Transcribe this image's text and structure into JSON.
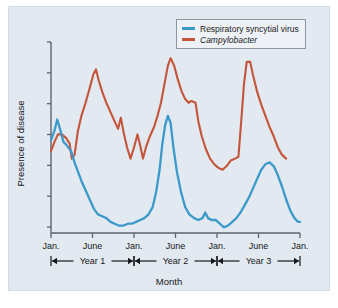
{
  "figure": {
    "background_color": "#e3e9f0",
    "frame_color": "#d2dae4"
  },
  "legend": {
    "position": "top-right",
    "entries": [
      {
        "label": "Respiratory syncytial virus",
        "color": "#3b9ac9",
        "italic": false,
        "swatch_name": "legend-swatch-rsv"
      },
      {
        "label": "Campylobacter",
        "color": "#c4543a",
        "italic": true,
        "swatch_name": "legend-swatch-campylobacter"
      }
    ]
  },
  "axes": {
    "y_title": "Presence of disease",
    "x_title": "Month",
    "y_tick_count": 7,
    "y_tick_labels": [
      "",
      "",
      "",
      "",
      "",
      "",
      ""
    ],
    "x_tick_labels": [
      "Jan.",
      "June",
      "Jan.",
      "June",
      "Jan.",
      "June",
      "Jan."
    ],
    "axis_color": "#5d646d"
  },
  "year_brackets": [
    {
      "label": "Year 1",
      "start_tick": 0,
      "end_tick": 2
    },
    {
      "label": "Year 2",
      "start_tick": 2,
      "end_tick": 4
    },
    {
      "label": "Year 3",
      "start_tick": 4,
      "end_tick": 6
    }
  ],
  "chart_data": {
    "type": "line",
    "title": "",
    "subtitle": "",
    "xlabel": "Month",
    "ylabel": "Presence of disease",
    "xlim": [
      0,
      36
    ],
    "ylim": [
      0,
      100
    ],
    "grid": false,
    "legend_position": "top right",
    "x_tick_positions": [
      0,
      6,
      12,
      18,
      24,
      30,
      36
    ],
    "x_tick_labels": [
      "Jan.",
      "June",
      "Jan.",
      "June",
      "Jan.",
      "June",
      "Jan."
    ],
    "y_axis_labeled": false,
    "annotations": [
      "Year 1",
      "Year 2",
      "Year 3"
    ],
    "x": [
      0,
      1,
      2,
      3,
      4,
      5,
      6,
      7,
      8,
      9,
      10,
      11,
      12,
      13,
      14,
      15,
      16,
      17,
      18,
      19,
      20,
      21,
      22,
      23,
      24,
      25,
      26,
      27,
      28,
      29,
      30,
      31,
      32,
      33,
      34,
      35,
      36
    ],
    "series": [
      {
        "name": "Respiratory syncytial virus",
        "color": "#3b9ac9",
        "values": [
          52,
          58,
          48,
          45,
          38,
          28,
          22,
          15,
          10,
          7,
          5,
          5,
          4,
          6,
          7,
          12,
          22,
          43,
          62,
          50,
          25,
          12,
          8,
          6,
          9,
          7,
          4,
          3,
          6,
          12,
          22,
          32,
          38,
          33,
          22,
          12,
          6
        ]
      },
      {
        "name": "Campylobacter",
        "color": "#c4543a",
        "values": [
          46,
          52,
          53,
          50,
          42,
          44,
          62,
          75,
          88,
          78,
          70,
          62,
          53,
          60,
          43,
          52,
          48,
          58,
          62,
          72,
          82,
          95,
          92,
          80,
          75,
          72,
          72,
          62,
          48,
          36,
          32,
          33,
          40,
          92,
          93,
          72,
          54
        ]
      }
    ],
    "series_full_resolution": {
      "note": "dense sampling used for rendering; x in months from start",
      "rsv": [
        [
          0.0,
          50
        ],
        [
          0.5,
          55
        ],
        [
          0.9,
          61
        ],
        [
          1.3,
          56
        ],
        [
          1.8,
          49
        ],
        [
          2.3,
          47
        ],
        [
          2.9,
          44
        ],
        [
          3.4,
          38
        ],
        [
          3.9,
          33
        ],
        [
          4.4,
          28
        ],
        [
          5.0,
          23
        ],
        [
          5.6,
          18
        ],
        [
          6.2,
          13
        ],
        [
          6.8,
          10
        ],
        [
          7.4,
          9
        ],
        [
          8.0,
          8
        ],
        [
          8.6,
          6
        ],
        [
          9.2,
          5
        ],
        [
          9.8,
          4
        ],
        [
          10.5,
          4
        ],
        [
          11.1,
          5
        ],
        [
          11.7,
          5
        ],
        [
          12.3,
          6
        ],
        [
          12.9,
          7
        ],
        [
          13.5,
          8
        ],
        [
          14.1,
          10
        ],
        [
          14.7,
          14
        ],
        [
          15.2,
          22
        ],
        [
          15.7,
          34
        ],
        [
          16.1,
          48
        ],
        [
          16.5,
          58
        ],
        [
          16.9,
          63
        ],
        [
          17.3,
          59
        ],
        [
          17.7,
          46
        ],
        [
          18.2,
          33
        ],
        [
          18.8,
          22
        ],
        [
          19.4,
          14
        ],
        [
          20.0,
          10
        ],
        [
          20.7,
          8
        ],
        [
          21.3,
          7
        ],
        [
          21.9,
          8
        ],
        [
          22.3,
          11
        ],
        [
          22.7,
          8
        ],
        [
          23.2,
          7
        ],
        [
          23.8,
          7
        ],
        [
          24.4,
          5
        ],
        [
          25.0,
          3
        ],
        [
          25.6,
          4
        ],
        [
          26.2,
          6
        ],
        [
          26.8,
          8
        ],
        [
          27.4,
          11
        ],
        [
          28.0,
          15
        ],
        [
          28.6,
          19
        ],
        [
          29.2,
          24
        ],
        [
          29.8,
          29
        ],
        [
          30.4,
          34
        ],
        [
          31.0,
          37
        ],
        [
          31.6,
          38
        ],
        [
          32.2,
          36
        ],
        [
          32.8,
          31
        ],
        [
          33.4,
          25
        ],
        [
          34.0,
          18
        ],
        [
          34.6,
          12
        ],
        [
          35.2,
          8
        ],
        [
          35.7,
          6
        ],
        [
          36.0,
          6
        ]
      ],
      "campylobacter": [
        [
          0.0,
          44
        ],
        [
          0.5,
          49
        ],
        [
          1.0,
          53
        ],
        [
          1.6,
          53
        ],
        [
          2.2,
          51
        ],
        [
          2.7,
          48
        ],
        [
          3.0,
          40
        ],
        [
          3.4,
          42
        ],
        [
          3.9,
          55
        ],
        [
          4.4,
          63
        ],
        [
          5.0,
          70
        ],
        [
          5.6,
          78
        ],
        [
          6.1,
          85
        ],
        [
          6.5,
          88
        ],
        [
          6.9,
          82
        ],
        [
          7.4,
          76
        ],
        [
          8.0,
          70
        ],
        [
          8.6,
          65
        ],
        [
          9.2,
          60
        ],
        [
          9.7,
          56
        ],
        [
          10.1,
          62
        ],
        [
          10.5,
          54
        ],
        [
          11.0,
          46
        ],
        [
          11.5,
          40
        ],
        [
          12.0,
          46
        ],
        [
          12.5,
          53
        ],
        [
          12.9,
          47
        ],
        [
          13.3,
          40
        ],
        [
          13.8,
          47
        ],
        [
          14.3,
          52
        ],
        [
          14.9,
          57
        ],
        [
          15.4,
          63
        ],
        [
          15.9,
          70
        ],
        [
          16.4,
          80
        ],
        [
          16.9,
          90
        ],
        [
          17.3,
          94
        ],
        [
          17.8,
          90
        ],
        [
          18.3,
          83
        ],
        [
          18.9,
          76
        ],
        [
          19.4,
          72
        ],
        [
          19.9,
          70
        ],
        [
          20.3,
          71
        ],
        [
          20.9,
          70
        ],
        [
          21.3,
          60
        ],
        [
          21.8,
          52
        ],
        [
          22.4,
          45
        ],
        [
          23.0,
          40
        ],
        [
          23.6,
          37
        ],
        [
          24.2,
          35
        ],
        [
          24.8,
          34
        ],
        [
          25.4,
          36
        ],
        [
          26.0,
          39
        ],
        [
          26.6,
          40
        ],
        [
          27.1,
          41
        ],
        [
          27.5,
          60
        ],
        [
          27.9,
          80
        ],
        [
          28.3,
          92
        ],
        [
          28.8,
          92
        ],
        [
          29.2,
          85
        ],
        [
          29.8,
          76
        ],
        [
          30.4,
          69
        ],
        [
          31.0,
          63
        ],
        [
          31.6,
          57
        ],
        [
          32.2,
          52
        ],
        [
          32.8,
          46
        ],
        [
          33.4,
          42
        ],
        [
          34.0,
          40
        ]
      ]
    }
  }
}
